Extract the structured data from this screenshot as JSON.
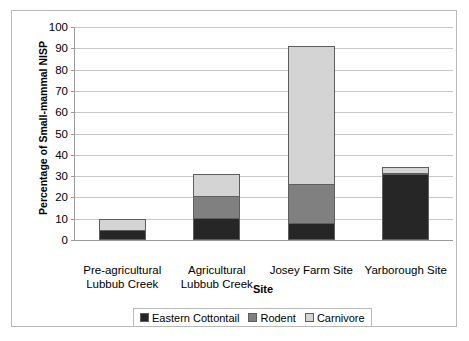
{
  "chart_data": {
    "type": "bar",
    "subtype": "stacked-bar",
    "title": "",
    "xlabel": "Site",
    "ylabel": "Percentage of Small-mammal NISP",
    "ylim": [
      0,
      100
    ],
    "yticks": [
      0,
      10,
      20,
      30,
      40,
      50,
      60,
      70,
      80,
      90,
      100
    ],
    "grid": true,
    "legend_position": "bottom",
    "categories": [
      "Pre-agricultural Lubbub Creek",
      "Agricultural Lubbub Creek",
      "Josey Farm Site",
      "Yarborough Site"
    ],
    "category_lines": [
      [
        "Pre-agricultural",
        "Lubbub Creek"
      ],
      [
        "Agricultural",
        "Lubbub Creek"
      ],
      [
        "Josey Farm Site",
        ""
      ],
      [
        "Yarborough Site",
        ""
      ]
    ],
    "series": [
      {
        "name": "Eastern Cottontail",
        "color": "#262626",
        "values": [
          4.5,
          10.5,
          8.0,
          31.0
        ]
      },
      {
        "name": "Rodent",
        "color": "#808080",
        "values": [
          0.0,
          10.5,
          19.0,
          1.0
        ]
      },
      {
        "name": "Carnivore",
        "color": "#d4d4d4",
        "values": [
          6.0,
          11.0,
          65.0,
          3.0
        ]
      }
    ],
    "totals": [
      10.5,
      32.0,
      92.0,
      35.0
    ]
  },
  "colors": {
    "frame_border": "#b9b9b9",
    "axis_line": "#9a9a9a",
    "gridline": "#c8c8c8",
    "bar_outline": "#5e5e5e",
    "text": "#000000",
    "background": "#ffffff"
  }
}
